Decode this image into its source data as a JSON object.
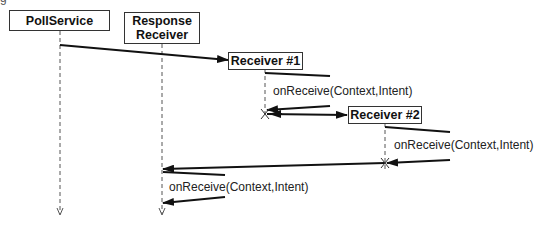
{
  "caption_fragment": "g",
  "participants": [
    {
      "id": "poll-service",
      "label": "PollService"
    },
    {
      "id": "response-receiver",
      "label_line1": "Response",
      "label_line2": "Receiver"
    },
    {
      "id": "receiver-1",
      "label": "Receiver #1"
    },
    {
      "id": "receiver-2",
      "label": "Receiver #2"
    }
  ],
  "messages": [
    {
      "from": "PollService",
      "to": "Receiver #1",
      "label": ""
    },
    {
      "from": "Receiver #1",
      "to": "Receiver #1",
      "label": "onReceive(Context,Intent)"
    },
    {
      "from": "Receiver #1",
      "to": "Receiver #2",
      "label": ""
    },
    {
      "from": "Receiver #2",
      "to": "Receiver #2",
      "label": "onReceive(Context,Intent)"
    },
    {
      "from": "Receiver #2",
      "to": "Response Receiver",
      "label": ""
    },
    {
      "from": "Response Receiver",
      "to": "Response Receiver",
      "label": "onReceive(Context,Intent)"
    }
  ],
  "colors": {
    "line": "#111111",
    "lifeline": "#555555"
  }
}
